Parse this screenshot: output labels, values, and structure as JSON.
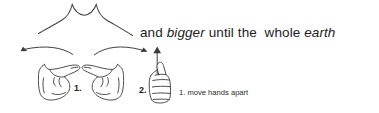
{
  "figure": {
    "caption": {
      "segments": [
        {
          "text": "and ",
          "style": "normal"
        },
        {
          "text": "bigger",
          "style": "italic"
        },
        {
          "text": " until the  whole ",
          "style": "normal"
        },
        {
          "text": "earth",
          "style": "italic"
        }
      ],
      "plain_text": "and bigger until the  whole earth",
      "part_1": "and ",
      "part_2_italic": "bigger",
      "part_3": " until the  whole ",
      "part_4_italic": "earth"
    },
    "steps": {
      "item_1": "1. move hands apart",
      "item_2": "2. raise right hand"
    },
    "step_markers": {
      "marker_1": "1.",
      "marker_2": "2."
    },
    "drawing": {
      "shapes": [
        "wide-spreading-curve-with-two-peaks",
        "left-pointing-hand-fist",
        "right-pointing-hand-fist",
        "upright-fist-thumb-up",
        "left-curved-arrow",
        "right-curved-arrow",
        "upward-straight-arrow"
      ],
      "stroke_color": "#3a3a3a",
      "background_color": "#ffffff"
    }
  }
}
